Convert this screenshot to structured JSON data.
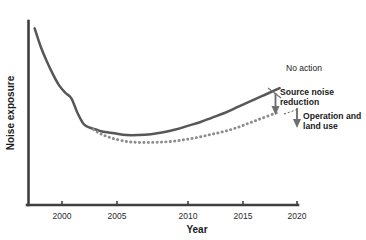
{
  "chart_data": {
    "type": "line",
    "title": "",
    "xlabel": "Year",
    "ylabel": "Noise exposure",
    "xlim": [
      1998,
      2020
    ],
    "ylim": [
      0,
      100
    ],
    "grid": false,
    "legend_position": "inline-annotations",
    "x_ticks": [
      "2000",
      "2005",
      "2010",
      "2015",
      "2020"
    ],
    "x_tick_values": [
      2000,
      2005,
      2010,
      2015,
      2020
    ],
    "y_ticks": [],
    "series": [
      {
        "name": "No action",
        "style": "solid",
        "color": "#575757",
        "x": [
          1998.5,
          1999,
          1999.5,
          2000,
          2000.5,
          2001,
          2001.5,
          2002,
          2002.5,
          2003,
          2003.5,
          2004,
          2005,
          2006,
          2007,
          2008,
          2009,
          2010,
          2011,
          2012,
          2013,
          2014,
          2015,
          2016,
          2017,
          2018,
          2018.5
        ],
        "y": [
          96,
          86,
          78,
          71,
          65,
          61,
          58,
          50,
          44,
          42,
          41,
          40,
          39,
          38,
          38,
          38.5,
          39.5,
          41,
          43,
          45,
          47.5,
          50,
          53,
          56,
          59,
          62,
          63.5
        ]
      },
      {
        "name": "Source noise reduction",
        "style": "dotted",
        "color": "#8d8d8d",
        "x": [
          2003.3,
          2003.8,
          2004.3,
          2005,
          2006,
          2007,
          2008,
          2009,
          2010,
          2011,
          2012,
          2013,
          2014,
          2015,
          2016,
          2017,
          2018,
          2018.4
        ],
        "y": [
          41,
          39,
          37.5,
          36,
          34.5,
          34,
          34,
          34.2,
          34.8,
          35.8,
          37,
          38.5,
          40,
          42,
          44.5,
          47,
          49.5,
          50.5
        ]
      }
    ],
    "annotations": [
      {
        "name": "no-action",
        "text": "No action",
        "bold": false
      },
      {
        "name": "source-noise-reduction",
        "text": "Source noise\nreduction",
        "bold": true
      },
      {
        "name": "operation-and-land-use",
        "text": "Operation and\nland use",
        "bold": true
      }
    ]
  },
  "axis": {
    "x_label": "Year",
    "y_label": "Noise exposure",
    "ticks": [
      {
        "label": "2000"
      },
      {
        "label": "2005"
      },
      {
        "label": "2010"
      },
      {
        "label": "2015"
      },
      {
        "label": "2020"
      }
    ]
  },
  "annotations": {
    "no_action": "No action",
    "source_noise_reduction": "Source noise\nreduction",
    "operation_land_use": "Operation and\nland use"
  },
  "colors": {
    "axis": "#3f3f3f",
    "no_action_line": "#575757",
    "reduction_line": "#8d8d8d",
    "arrow": "#6e6e6e",
    "text": "#1a1a1a",
    "background": "#ffffff"
  }
}
